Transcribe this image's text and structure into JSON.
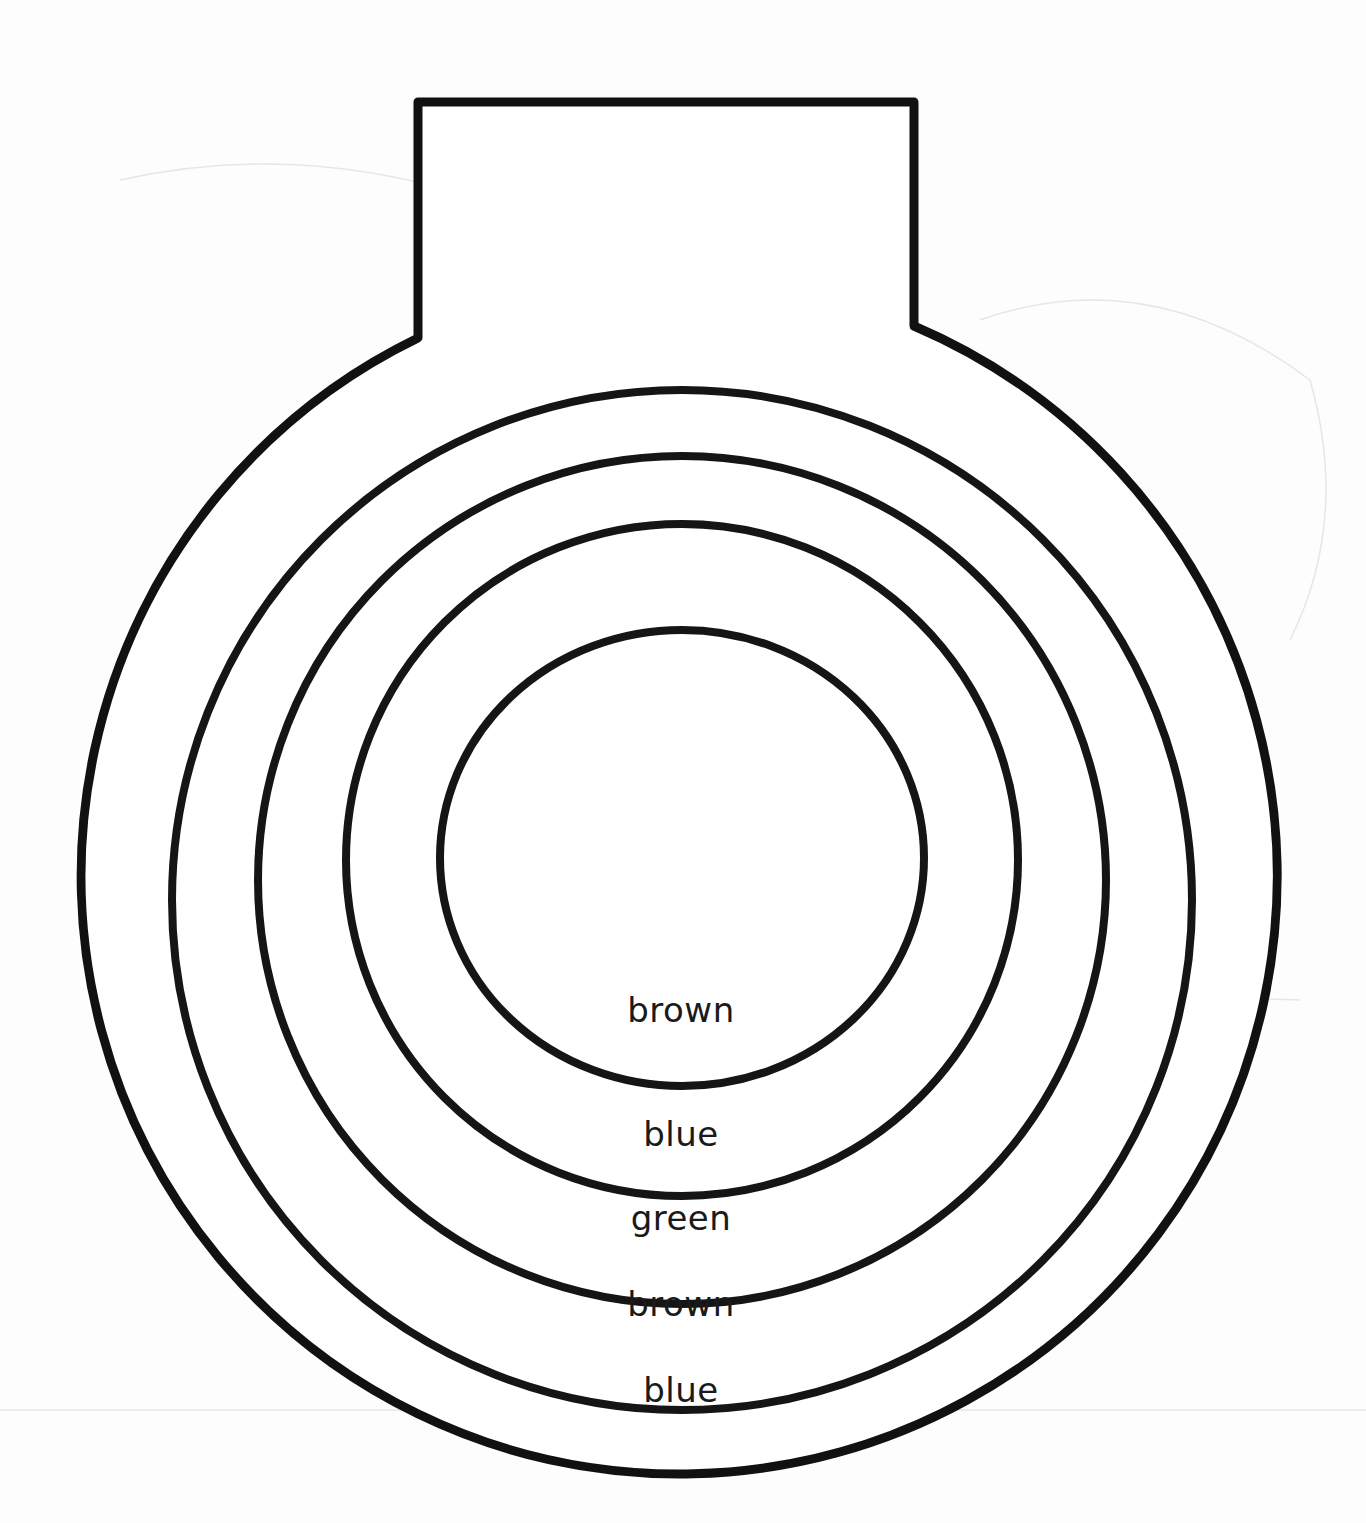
{
  "worksheet": {
    "shape": "round ornament with rectangular tab on top, concentric rings",
    "outline_color": "#111111",
    "ring_labels": [
      {
        "ring": 1,
        "position": "innermost circle",
        "label": "brown"
      },
      {
        "ring": 2,
        "position": "second band",
        "label": "blue"
      },
      {
        "ring": 3,
        "position": "third band",
        "label": "green"
      },
      {
        "ring": 4,
        "position": "fourth band",
        "label": "brown"
      },
      {
        "ring": 5,
        "position": "outermost band",
        "label": "blue"
      }
    ],
    "labels": {
      "inner": "brown",
      "band2": "blue",
      "band3": "green",
      "band4": "brown",
      "band5": "blue"
    }
  }
}
